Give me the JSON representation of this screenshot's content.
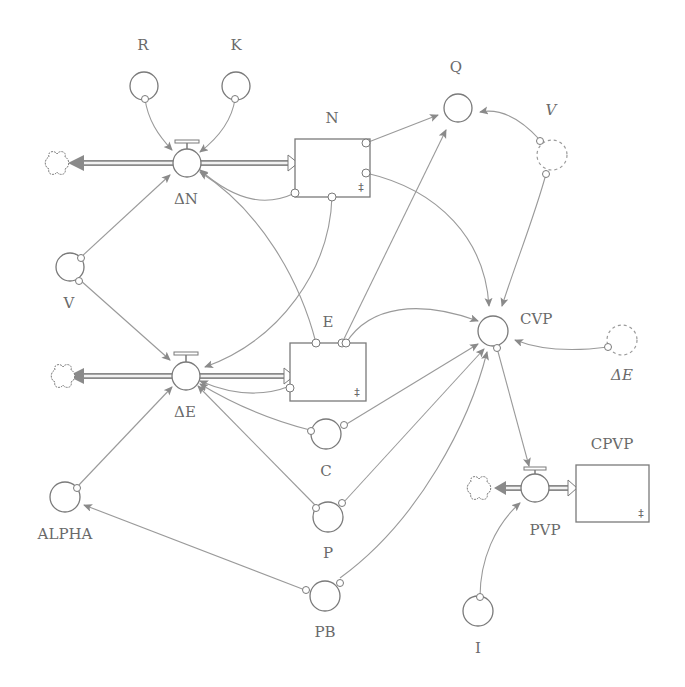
{
  "diagram": {
    "type": "stock-and-flow",
    "stocks": [
      {
        "id": "N",
        "label": "N"
      },
      {
        "id": "E",
        "label": "E"
      },
      {
        "id": "CPVP",
        "label": "CPVP"
      }
    ],
    "flows": [
      {
        "id": "dN",
        "label": "ΔN",
        "to": "N"
      },
      {
        "id": "dE",
        "label": "ΔE",
        "to": "E"
      },
      {
        "id": "PVP",
        "label": "PVP",
        "to": "CPVP"
      }
    ],
    "converters": [
      {
        "id": "R",
        "label": "R"
      },
      {
        "id": "K",
        "label": "K"
      },
      {
        "id": "Q",
        "label": "Q"
      },
      {
        "id": "V",
        "label": "V"
      },
      {
        "id": "CVP",
        "label": "CVP"
      },
      {
        "id": "C",
        "label": "C"
      },
      {
        "id": "P",
        "label": "P"
      },
      {
        "id": "ALPHA",
        "label": "ALPHA"
      },
      {
        "id": "PB",
        "label": "PB"
      },
      {
        "id": "I",
        "label": "I"
      }
    ],
    "ghosts": [
      {
        "id": "V_ghost",
        "label": "V"
      },
      {
        "id": "dE_ghost",
        "label": "ΔE"
      }
    ],
    "stock_symbol": "‡",
    "links": [
      [
        "R",
        "dN"
      ],
      [
        "K",
        "dN"
      ],
      [
        "N",
        "dN"
      ],
      [
        "E",
        "dN"
      ],
      [
        "V",
        "dN"
      ],
      [
        "V",
        "dE"
      ],
      [
        "N",
        "dE"
      ],
      [
        "E",
        "dE"
      ],
      [
        "C",
        "dE"
      ],
      [
        "P",
        "dE"
      ],
      [
        "ALPHA",
        "dE"
      ],
      [
        "N",
        "Q"
      ],
      [
        "E",
        "Q"
      ],
      [
        "V_ghost",
        "Q"
      ],
      [
        "N",
        "CVP"
      ],
      [
        "E",
        "CVP"
      ],
      [
        "V_ghost",
        "CVP"
      ],
      [
        "dE_ghost",
        "CVP"
      ],
      [
        "C",
        "CVP"
      ],
      [
        "P",
        "CVP"
      ],
      [
        "PB",
        "CVP"
      ],
      [
        "CVP",
        "PVP"
      ],
      [
        "I",
        "PVP"
      ],
      [
        "PB",
        "ALPHA"
      ]
    ]
  }
}
